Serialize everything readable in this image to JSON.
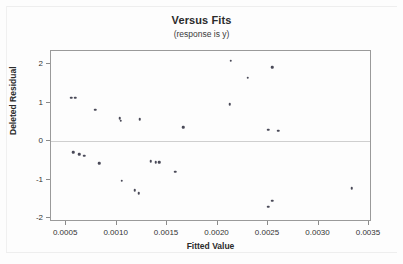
{
  "chart_data": {
    "type": "scatter",
    "title": "Versus Fits",
    "subtitle": "(response is y)",
    "xlabel": "Fitted Value",
    "ylabel": "Deleted Residual",
    "xlim": [
      0.00035,
      0.00353
    ],
    "ylim": [
      -2.1,
      2.35
    ],
    "xticks": [
      0.0005,
      0.001,
      0.0015,
      0.002,
      0.0025,
      0.003,
      0.0035
    ],
    "xtick_labels": [
      "0.0005",
      "0.0010",
      "0.0015",
      "0.0020",
      "0.0025",
      "0.0030",
      "0.0035"
    ],
    "yticks": [
      2,
      1,
      0,
      -1,
      -2
    ],
    "ytick_labels": [
      "2",
      "1",
      "0",
      "-1",
      "-2"
    ],
    "grid": false,
    "legend": null,
    "reference_line": 0,
    "marker_color": "#4a4a58",
    "frame_color": "#9a9a9a",
    "points": [
      {
        "x": 0.00055,
        "y": 1.13
      },
      {
        "x": 0.00059,
        "y": 1.13
      },
      {
        "x": 0.00079,
        "y": 0.82
      },
      {
        "x": 0.00103,
        "y": 0.6
      },
      {
        "x": 0.00104,
        "y": 0.54
      },
      {
        "x": 0.00123,
        "y": 0.58
      },
      {
        "x": 0.00166,
        "y": 0.37
      },
      {
        "x": 0.00213,
        "y": 2.1
      },
      {
        "x": 0.0023,
        "y": 1.65
      },
      {
        "x": 0.00254,
        "y": 1.93
      },
      {
        "x": 0.00212,
        "y": 0.97
      },
      {
        "x": 0.0025,
        "y": 0.3
      },
      {
        "x": 0.0026,
        "y": 0.27
      },
      {
        "x": 0.00057,
        "y": -0.28
      },
      {
        "x": 0.00063,
        "y": -0.34
      },
      {
        "x": 0.00068,
        "y": -0.37
      },
      {
        "x": 0.00083,
        "y": -0.57
      },
      {
        "x": 0.00134,
        "y": -0.52
      },
      {
        "x": 0.00139,
        "y": -0.54
      },
      {
        "x": 0.00142,
        "y": -0.54
      },
      {
        "x": 0.00158,
        "y": -0.79
      },
      {
        "x": 0.00105,
        "y": -1.03
      },
      {
        "x": 0.00118,
        "y": -1.27
      },
      {
        "x": 0.00122,
        "y": -1.35
      },
      {
        "x": 0.0025,
        "y": -1.7
      },
      {
        "x": 0.00254,
        "y": -1.55
      },
      {
        "x": 0.00333,
        "y": -1.22
      }
    ]
  }
}
